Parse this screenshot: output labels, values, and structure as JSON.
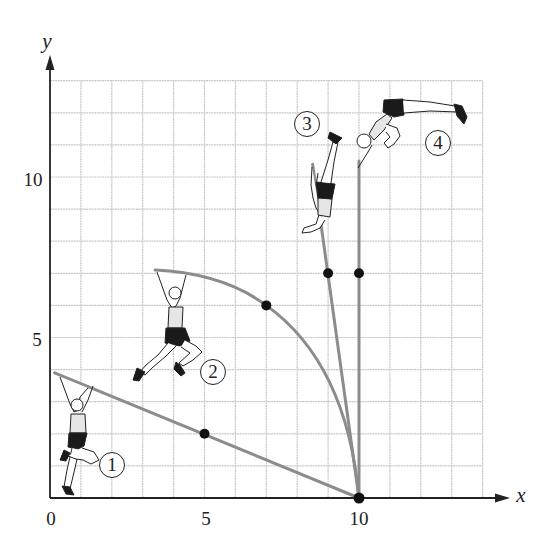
{
  "figure": {
    "axes": {
      "x": {
        "label": "x",
        "ticks": [
          {
            "value": 0,
            "label": "0"
          },
          {
            "value": 5,
            "label": "5"
          },
          {
            "value": 10,
            "label": "10"
          }
        ],
        "range": [
          0,
          14
        ]
      },
      "y": {
        "label": "y",
        "ticks": [
          {
            "value": 5,
            "label": "5"
          },
          {
            "value": 10,
            "label": "10"
          }
        ],
        "range": [
          0,
          13
        ]
      },
      "grid": true,
      "grid_spacing": 1
    },
    "pixel_mapping": {
      "origin_px": [
        50,
        498
      ],
      "unit_x_px": 30.9,
      "unit_y_px": 32.1
    },
    "colors": {
      "pole": "#8c8c8c",
      "grid": "#c8c8c8",
      "axis": "#222222",
      "dot": "#111111",
      "shorts": "#1a1a1a",
      "shirt": "#e6e6e6"
    },
    "stages": [
      {
        "id": 1,
        "label": "1",
        "label_pos": [
          2.0,
          1.0
        ],
        "pole": {
          "shape": "line",
          "from": [
            0.15,
            3.9
          ],
          "to": [
            10,
            0
          ]
        },
        "marker": [
          5,
          2
        ]
      },
      {
        "id": 2,
        "label": "2",
        "label_pos": [
          5.3,
          3.9
        ],
        "pole": {
          "shape": "curve",
          "from": [
            3.4,
            7.1
          ],
          "through": [
            7,
            6
          ],
          "to": [
            10,
            0
          ]
        },
        "marker": [
          7,
          6
        ]
      },
      {
        "id": 3,
        "label": "3",
        "label_pos": [
          8.3,
          11.65
        ],
        "pole": {
          "shape": "line",
          "from": [
            8.5,
            10.4
          ],
          "to": [
            10,
            0
          ]
        },
        "marker": [
          9,
          7
        ]
      },
      {
        "id": 4,
        "label": "4",
        "label_pos": [
          12.55,
          11.05
        ],
        "pole": {
          "shape": "line",
          "from": [
            10,
            10.5
          ],
          "to": [
            10,
            0
          ]
        },
        "marker": [
          10,
          7
        ]
      }
    ],
    "pivot_point": [
      10,
      0
    ]
  }
}
